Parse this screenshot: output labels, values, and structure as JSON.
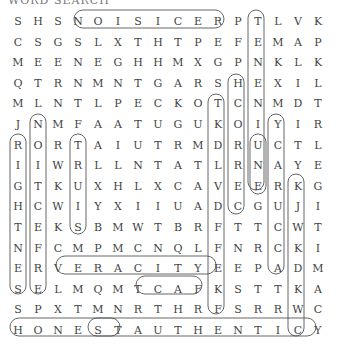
{
  "header": "WORD SEARCH",
  "grid": [
    "SHSNOISICERPTLVK",
    "CSGSLXTHTPEFEMAP",
    "MEENEGHHMXGPNKLK",
    "QTRNMNTGARSHEXIL",
    "MLNTLPECKOTCNMDT",
    "JNMFAATUGUKOIYIR",
    "RORTAIUTRMDRUCTL",
    "IIWRLLNTATLRNAYE",
    "GTKUXHLXCAVEERKG",
    "HCWIYXIIUADCGUJI",
    "TEKSBMWTBRFTTCWT",
    "NFCMPMCNQLFNRCKI",
    "ERVERACITYEEPADM",
    "SELMQMTCAFKSTTKA",
    "SPXTMNRTHRFSRRWC",
    "HONESTAUTHENTICY"
  ],
  "found_words": [
    "PRECISION",
    "VALIDITY",
    "CERTAINTY",
    "TRUTH",
    "VERACITY",
    "FACT",
    "HONEST",
    "AUTHENTIC",
    "LEGITIMACY",
    "RIGHTNESS",
    "NOTICE",
    "TRUISM",
    "PRESENT",
    "CORRECT",
    "GENUINE",
    "ACCURACY",
    "LEGIT"
  ]
}
